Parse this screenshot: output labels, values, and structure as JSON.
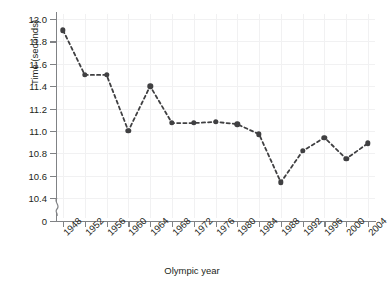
{
  "chart_data": {
    "type": "line",
    "title": "",
    "xlabel": "Olympic year",
    "ylabel": "Time (seconds)",
    "categories": [
      "1948",
      "1952",
      "1956",
      "1960",
      "1964",
      "1968",
      "1972",
      "1976",
      "1980",
      "1984",
      "1988",
      "1992",
      "1996",
      "2000",
      "2004"
    ],
    "values": [
      11.9,
      11.5,
      11.5,
      11.0,
      11.4,
      11.07,
      11.07,
      11.08,
      11.06,
      10.97,
      10.54,
      10.82,
      10.94,
      10.75,
      10.89
    ],
    "series": [
      {
        "name": "Winning time",
        "values": [
          11.9,
          11.5,
          11.5,
          11.0,
          11.4,
          11.07,
          11.07,
          11.08,
          11.06,
          10.97,
          10.54,
          10.82,
          10.94,
          10.75,
          10.89
        ]
      }
    ],
    "ylim": [
      10.4,
      12.0
    ],
    "y_ticks": [
      "0",
      "10.4",
      "10.6",
      "10.8",
      "11.0",
      "11.2",
      "11.4",
      "11.6",
      "11.8",
      "12.0"
    ],
    "y_tick_values": [
      10.4,
      10.6,
      10.8,
      11.0,
      11.2,
      11.4,
      11.6,
      11.8,
      12.0
    ],
    "y_zero_tick_label": "0",
    "x_ticks": [
      "1948",
      "1952",
      "1956",
      "1960",
      "1964",
      "1968",
      "1972",
      "1976",
      "1980",
      "1984",
      "1988",
      "1992",
      "1996",
      "2000",
      "2004"
    ],
    "grid": true,
    "legend": "none",
    "axis_break": true,
    "marker_style": "filled-circle",
    "line_style": "dashed",
    "colors": {
      "marker": "#404042",
      "line": "#404042",
      "grid": "#f1f1f2",
      "axis": "#808285",
      "text": "#231f20",
      "background": "#ffffff"
    }
  }
}
